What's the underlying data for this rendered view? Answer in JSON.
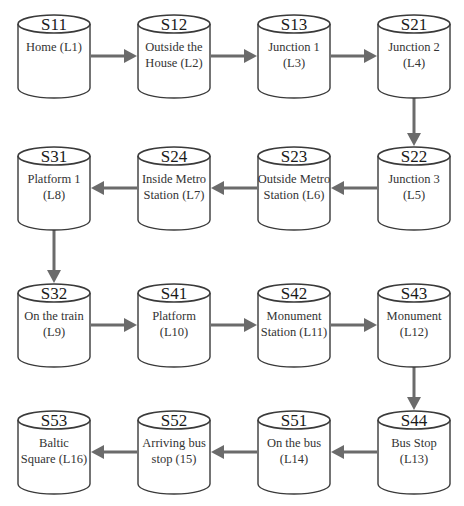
{
  "diagram": {
    "type": "flow",
    "colors": {
      "outline": "#3a3a3a",
      "arrow": "#6b6b6b",
      "text": "#1a1a1a",
      "background": "#ffffff"
    },
    "nodes": [
      {
        "id": "S11",
        "label": "Home (L1)",
        "row": 0,
        "col": 0
      },
      {
        "id": "S12",
        "label": "Outside the\nHouse (L2)",
        "row": 0,
        "col": 1
      },
      {
        "id": "S13",
        "label": "Junction 1\n(L3)",
        "row": 0,
        "col": 2
      },
      {
        "id": "S21",
        "label": "Junction 2\n(L4)",
        "row": 0,
        "col": 3
      },
      {
        "id": "S22",
        "label": "Junction 3\n(L5)",
        "row": 1,
        "col": 3
      },
      {
        "id": "S23",
        "label": "Outside Metro\nStation (L6)",
        "row": 1,
        "col": 2
      },
      {
        "id": "S24",
        "label": "Inside Metro\nStation (L7)",
        "row": 1,
        "col": 1
      },
      {
        "id": "S31",
        "label": "Platform 1\n(L8)",
        "row": 1,
        "col": 0
      },
      {
        "id": "S32",
        "label": "On the train\n(L9)",
        "row": 2,
        "col": 0
      },
      {
        "id": "S41",
        "label": "Platform\n(L10)",
        "row": 2,
        "col": 1
      },
      {
        "id": "S42",
        "label": "Monument\nStation (L11)",
        "row": 2,
        "col": 2
      },
      {
        "id": "S43",
        "label": "Monument\n(L12)",
        "row": 2,
        "col": 3
      },
      {
        "id": "S44",
        "label": "Bus Stop\n(L13)",
        "row": 3,
        "col": 3
      },
      {
        "id": "S51",
        "label": "On the bus\n(L14)",
        "row": 3,
        "col": 2
      },
      {
        "id": "S52",
        "label": "Arriving bus\nstop (15)",
        "row": 3,
        "col": 1
      },
      {
        "id": "S53",
        "label": "Baltic\nSquare (L16)",
        "row": 3,
        "col": 0
      }
    ],
    "edges": [
      [
        "S11",
        "S12"
      ],
      [
        "S12",
        "S13"
      ],
      [
        "S13",
        "S21"
      ],
      [
        "S21",
        "S22"
      ],
      [
        "S22",
        "S23"
      ],
      [
        "S23",
        "S24"
      ],
      [
        "S24",
        "S31"
      ],
      [
        "S31",
        "S32"
      ],
      [
        "S32",
        "S41"
      ],
      [
        "S41",
        "S42"
      ],
      [
        "S42",
        "S43"
      ],
      [
        "S43",
        "S44"
      ],
      [
        "S44",
        "S51"
      ],
      [
        "S51",
        "S52"
      ],
      [
        "S52",
        "S53"
      ]
    ],
    "layout": {
      "col_x": [
        17,
        137,
        257,
        377
      ],
      "row_y": [
        14,
        146,
        283,
        410
      ]
    }
  }
}
